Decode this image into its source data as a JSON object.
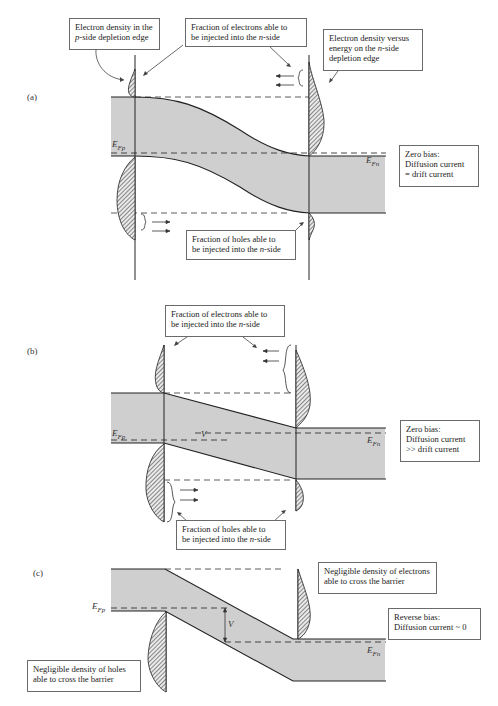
{
  "figure": {
    "panels": [
      {
        "id": "a",
        "label": "(a)",
        "annotations": {
          "p_side_electron": [
            "Electron density in the",
            "p-side depletion edge"
          ],
          "electron_fraction": [
            "Fraction of electrons able to",
            "be injected into the n-side"
          ],
          "n_side_density": [
            "Electron density versus",
            "energy on the n-side",
            "depletion edge"
          ],
          "hole_fraction": [
            "Fraction of holes able to",
            "be injected into the n-side"
          ],
          "bias_state": [
            "Zero bias:",
            "Diffusion current",
            "= drift current"
          ]
        },
        "fermi_p": "E",
        "fermi_p_sub": "Fp",
        "fermi_n": "E",
        "fermi_n_sub": "Fn"
      },
      {
        "id": "b",
        "label": "(b)",
        "annotations": {
          "electron_fraction": [
            "Fraction of electrons able to",
            "be injected into the n-side"
          ],
          "hole_fraction": [
            "Fraction of holes able to",
            "be injected into the n-side"
          ],
          "bias_state": [
            "Zero bias:",
            "Diffusion current",
            ">> drift current"
          ]
        },
        "voltage": "V",
        "fermi_p": "E",
        "fermi_p_sub": "Fp",
        "fermi_n": "E",
        "fermi_n_sub": "Fn"
      },
      {
        "id": "c",
        "label": "(c)",
        "annotations": {
          "electron_negligible": [
            "Negligible density of electrons",
            "able to cross the barrier"
          ],
          "hole_negligible": [
            "Negligible density of holes",
            "able to cross the barrier"
          ],
          "bias_state": [
            "Reverse bias:",
            "Diffusion current ~ 0"
          ]
        },
        "voltage": "V",
        "fermi_p": "E",
        "fermi_p_sub": "Fp",
        "fermi_n": "E",
        "fermi_n_sub": "Fn"
      }
    ],
    "colors": {
      "band_fill": "#cfcfcf",
      "line": "#222222",
      "box_border": "#6a6a6a"
    }
  }
}
